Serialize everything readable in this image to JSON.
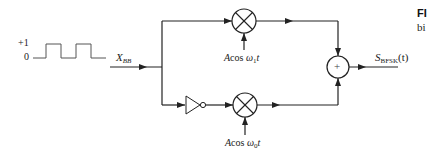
{
  "diagram": {
    "type": "BFSK modulator block diagram",
    "input_waveform": {
      "high_label": "+1",
      "low_label": "0"
    },
    "input_signal": {
      "symbol": "X",
      "subscript": "BB"
    },
    "upper_branch": {
      "multiplier_label": "A",
      "carrier_func": "cos",
      "omega": "ω",
      "omega_sub": "1",
      "time": "t"
    },
    "lower_branch": {
      "inverter": "NOT",
      "multiplier_label": "A",
      "carrier_func": "cos",
      "omega": "ω",
      "omega_sub": "0",
      "time": "t"
    },
    "adder": {
      "symbol": "+"
    },
    "output_signal": {
      "symbol": "S",
      "subscript": "BFSK",
      "arg": "(t)"
    },
    "caption": {
      "prefix": "FI",
      "line2": "bi"
    },
    "colors": {
      "line": "#222222",
      "background": "#ffffff"
    }
  }
}
